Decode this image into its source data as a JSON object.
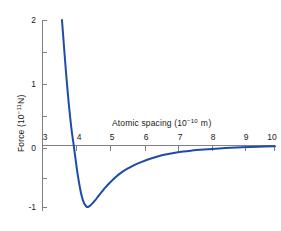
{
  "chart_data": {
    "type": "line",
    "title": "",
    "xlabel": "Atomic spacing (10−10 m)",
    "xlabel_base": "Atomic spacing (10",
    "xlabel_exp": "−10",
    "xlabel_tail": " m)",
    "ylabel": "Force (10−11 N)",
    "ylabel_base": "Force (10",
    "ylabel_exp": "−11",
    "ylabel_tail": "N)",
    "xlim": [
      3,
      10
    ],
    "ylim": [
      -1.15,
      2.05
    ],
    "grid": false,
    "legend": null,
    "x_major_ticks": [
      3,
      4,
      5,
      6,
      7,
      8,
      9,
      10
    ],
    "x_tick_labels": [
      "3",
      "4",
      "5",
      "6",
      "7",
      "8",
      "9",
      "10"
    ],
    "y_major_ticks": [
      2,
      1,
      0,
      -1
    ],
    "y_tick_labels": [
      "2",
      "1",
      "0",
      "-1"
    ],
    "y_minor_ticks": [
      1.5,
      0.5,
      -0.5
    ],
    "zero_crossing_x": 3.95,
    "minimum": {
      "x": 4.35,
      "y": -1.0
    },
    "line_color": "#1f4ba8",
    "axis_color": "#808080",
    "series": [
      {
        "name": "Interatomic force",
        "x": [
          3.6,
          3.64,
          3.68,
          3.72,
          3.76,
          3.8,
          3.85,
          3.9,
          3.95,
          4.0,
          4.05,
          4.1,
          4.15,
          4.2,
          4.25,
          4.3,
          4.35,
          4.4,
          4.45,
          4.5,
          4.6,
          4.7,
          4.8,
          4.9,
          5.0,
          5.2,
          5.4,
          5.6,
          5.8,
          6.0,
          6.25,
          6.5,
          6.75,
          7.0,
          7.25,
          7.5,
          7.75,
          8.0,
          8.5,
          9.0,
          9.5,
          10.0
        ],
        "y": [
          2.0,
          1.72,
          1.44,
          1.17,
          0.92,
          0.68,
          0.42,
          0.19,
          0.0,
          -0.2,
          -0.4,
          -0.57,
          -0.72,
          -0.84,
          -0.92,
          -0.97,
          -1.0,
          -0.995,
          -0.975,
          -0.95,
          -0.89,
          -0.82,
          -0.755,
          -0.69,
          -0.63,
          -0.525,
          -0.44,
          -0.375,
          -0.32,
          -0.275,
          -0.225,
          -0.185,
          -0.155,
          -0.13,
          -0.11,
          -0.095,
          -0.082,
          -0.072,
          -0.055,
          -0.042,
          -0.032,
          -0.025
        ]
      }
    ]
  },
  "axes_pixels": {
    "x_tick_px": [
      42,
      76,
      110,
      145,
      178,
      212,
      245,
      274
    ],
    "y_major_px": [
      20,
      84,
      148,
      207
    ],
    "y_minor_px": [
      52,
      116,
      178
    ],
    "axis_x_px": 42,
    "axis_y_px": 148,
    "axis_right_px": 275,
    "axis_top_px": 20,
    "axis_bottom_px": 211
  }
}
